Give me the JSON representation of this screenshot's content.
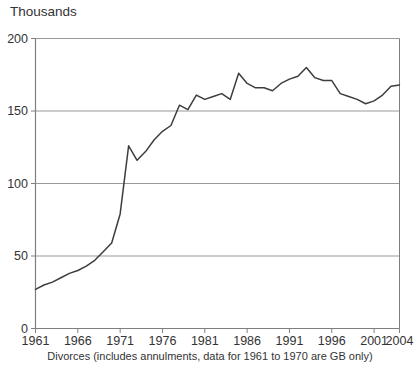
{
  "figure": {
    "unit_label": "Thousands",
    "caption": "Divorces (includes annulments, data for 1961 to 1970 are GB only)"
  },
  "colors": {
    "background": "#ffffff",
    "line": "#3d3d3d",
    "grid": "#999999",
    "frame": "#7f7f7f",
    "text": "#333333"
  },
  "chart_data": {
    "type": "line",
    "title": "",
    "ylabel": "Thousands",
    "xlabel": "",
    "caption": "Divorces (includes annulments, data for 1961 to 1970 are GB only)",
    "xlim": [
      1961,
      2004
    ],
    "ylim": [
      0,
      200
    ],
    "x_ticks": [
      1961,
      1966,
      1971,
      1976,
      1981,
      1986,
      1991,
      1996,
      2001,
      2004
    ],
    "y_ticks": [
      0,
      50,
      100,
      150,
      200
    ],
    "grid": "horizontal",
    "legend": "none",
    "series": [
      {
        "name": "Divorces (thousands)",
        "x": [
          1961,
          1962,
          1963,
          1964,
          1965,
          1966,
          1967,
          1968,
          1969,
          1970,
          1971,
          1972,
          1973,
          1974,
          1975,
          1976,
          1977,
          1978,
          1979,
          1980,
          1981,
          1982,
          1983,
          1984,
          1985,
          1986,
          1987,
          1988,
          1989,
          1990,
          1991,
          1992,
          1993,
          1994,
          1995,
          1996,
          1997,
          1998,
          1999,
          2000,
          2001,
          2002,
          2003,
          2004
        ],
        "values": [
          27,
          30,
          32,
          35,
          38,
          40,
          43,
          47,
          53,
          59,
          79,
          126,
          116,
          122,
          130,
          136,
          140,
          154,
          151,
          161,
          158,
          160,
          162,
          158,
          176,
          169,
          166,
          166,
          164,
          169,
          172,
          174,
          180,
          173,
          171,
          171,
          162,
          160,
          158,
          155,
          157,
          161,
          167,
          168
        ]
      }
    ]
  }
}
